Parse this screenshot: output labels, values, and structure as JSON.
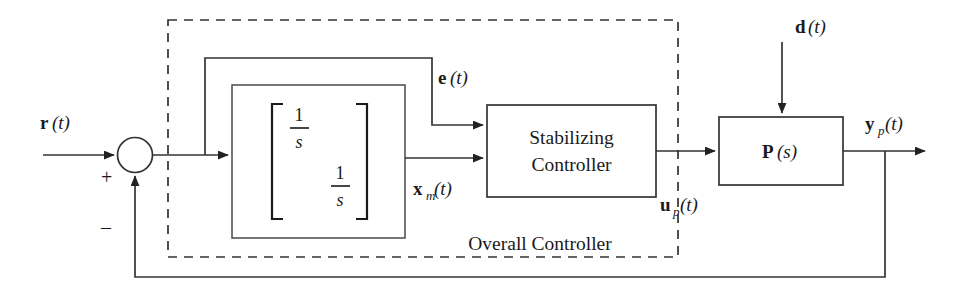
{
  "diagram": {
    "canvas": {
      "width": 967,
      "height": 294,
      "background": "#ffffff"
    },
    "line_color": "#333333",
    "text_color": "#1a1a1a"
  },
  "signals": {
    "reference": {
      "base": "r",
      "sub": "",
      "arg": "(t)"
    },
    "error": {
      "base": "e",
      "sub": "",
      "arg": "(t)"
    },
    "model_state": {
      "base": "x",
      "sub": "m",
      "arg": "(t)"
    },
    "plant_input": {
      "base": "u",
      "sub": "p",
      "arg": "(t)"
    },
    "disturbance": {
      "base": "d",
      "sub": "",
      "arg": "(t)"
    },
    "plant_output": {
      "base": "y",
      "sub": "p",
      "arg": "(t)"
    }
  },
  "summing_junction": {
    "plus_label": "+",
    "minus_label": "–"
  },
  "blocks": {
    "integrator_bank": {
      "matrix_entries": [
        "1/s",
        "1/s"
      ],
      "numerator": "1",
      "denominator": "s",
      "bracket_open": "[",
      "bracket_close": "]"
    },
    "stabilizing_controller": {
      "line1": "Stabilizing",
      "line2": "Controller"
    },
    "plant": {
      "base": "P",
      "arg": "(s)"
    }
  },
  "annotations": {
    "overall_controller": "Overall Controller"
  }
}
